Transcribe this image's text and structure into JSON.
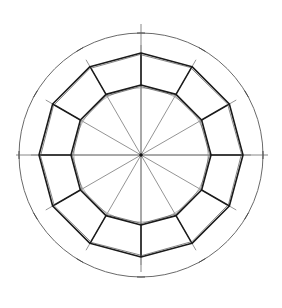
{
  "diagram": {
    "polygon_sides": 12,
    "radial_divisions": 12,
    "division_angle_degrees": 30,
    "elements": [
      {
        "name": "outer-construction-circle",
        "kind": "circle"
      },
      {
        "name": "outer-dodecagon",
        "kind": "polygon",
        "sides": 12
      },
      {
        "name": "inner-dodecagon",
        "kind": "polygon",
        "sides": 12
      },
      {
        "name": "inner-construction-circle",
        "kind": "circle"
      },
      {
        "name": "radial-lines",
        "kind": "lines",
        "count": 12
      },
      {
        "name": "center-point",
        "kind": "point"
      },
      {
        "name": "tick-marks",
        "kind": "ticks",
        "count": 12
      }
    ],
    "colors": {
      "background": "#ffffff",
      "thick_stroke": "#1a1a1a",
      "thin_stroke": "#888888",
      "circle_stroke": "#6a6a6a"
    }
  }
}
